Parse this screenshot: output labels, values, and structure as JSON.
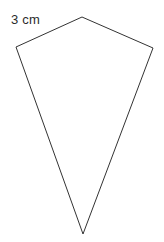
{
  "figure": {
    "kind": "geometry-diagram",
    "shape_name": "kite-quadrilateral",
    "background_color": "#ffffff",
    "stroke_color": "#333333",
    "stroke_width": 1,
    "fill_color": "#ffffff",
    "vertices": [
      {
        "name": "top-apex",
        "x": 82,
        "y": 17
      },
      {
        "name": "right-vertex",
        "x": 153,
        "y": 48
      },
      {
        "name": "bottom-apex",
        "x": 83,
        "y": 234
      },
      {
        "name": "left-vertex",
        "x": 16,
        "y": 47
      }
    ],
    "edges": [
      {
        "name": "top-left-edge",
        "from": "left-vertex",
        "to": "top-apex",
        "label": "3 cm"
      },
      {
        "name": "top-right-edge",
        "from": "top-apex",
        "to": "right-vertex",
        "label": ""
      },
      {
        "name": "bottom-right-edge",
        "from": "right-vertex",
        "to": "bottom-apex",
        "label": ""
      },
      {
        "name": "bottom-left-edge",
        "from": "bottom-apex",
        "to": "left-vertex",
        "label": ""
      }
    ],
    "labels": [
      {
        "name": "side-length-label",
        "text": "3 cm",
        "x": 11,
        "y": 12,
        "color": "#2b2b2b",
        "font_size": 13
      }
    ]
  }
}
